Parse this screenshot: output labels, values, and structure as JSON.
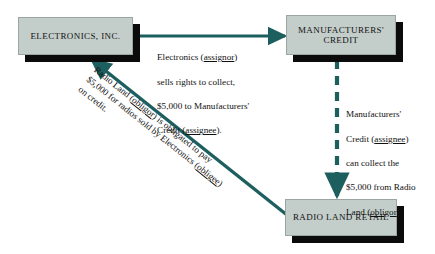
{
  "colors": {
    "arrow": "#1d5e5e",
    "box_fill": "#c3cdc9",
    "box_shadow": "#0b0b0b",
    "background": "#ffffff",
    "text": "#111111"
  },
  "nodes": {
    "electronics": {
      "label": "ELECTRONICS, INC."
    },
    "manufacturers_credit": {
      "line1": "MANUFACTURERS'",
      "line2": "CREDIT"
    },
    "radio_land": {
      "label": "RADIO LAND RETAIL"
    }
  },
  "captions": {
    "assignment": {
      "line1_pre": "Electronics (",
      "line1_underline": "assignor",
      "line1_post": ")",
      "line2": "sells rights to collect,",
      "line3": "$5,000 to Manufacturers'",
      "line4_pre": "Credit (",
      "line4_underline": "assignee",
      "line4_post": ")."
    },
    "collection": {
      "line1": "Manufacturers'",
      "line2_pre": "Credit (",
      "line2_underline": "assignee",
      "line2_post": ")",
      "line3": "can collect the",
      "line4": "$5,000 from Radio",
      "line5_pre": "Land (",
      "line5_underline": "obligor",
      "line5_post": ")."
    },
    "obligation": {
      "line1_pre": "Radio Land (",
      "line1_underline": "obligor",
      "line1_post": ") is obligated to pay",
      "line2_pre": "$5,000 for radios sold by Electronics (",
      "line2_underline": "obligee",
      "line2_post": ")",
      "line3": "on credit."
    }
  },
  "arrows": {
    "assignment_arrow": {
      "style": "solid",
      "direction": "right"
    },
    "collection_arrow": {
      "style": "dashed",
      "direction": "down"
    },
    "obligation_arrow": {
      "style": "solid",
      "direction": "up-left"
    }
  }
}
